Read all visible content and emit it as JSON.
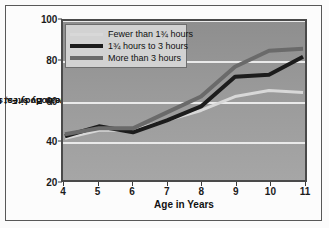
{
  "chart_data": {
    "type": "line",
    "title": "",
    "xlabel": "Age in Years",
    "ylabel": "Mean Body Fat Index (mm of fat at five body sites, summed)",
    "ylabel_line1": "Mean Body Fat Index (mm of",
    "ylabel_line2": "fat at five body sites, summed)",
    "x": [
      4,
      5,
      6,
      7,
      8,
      9,
      10,
      11
    ],
    "categories": [
      "4",
      "5",
      "6",
      "7",
      "8",
      "9",
      "10",
      "11"
    ],
    "xlim": [
      4,
      11
    ],
    "ylim": [
      20,
      100
    ],
    "yticks": [
      20,
      40,
      60,
      80,
      100
    ],
    "ytick_labels": [
      "20",
      "40",
      "60",
      "80",
      "100"
    ],
    "grid": true,
    "grid_color": "#eaeaea",
    "legend_position": "upper-left",
    "plot_background": "#9a9a9a",
    "series": [
      {
        "name": "Fewer than 1¾ hours",
        "color": "#d8d8d8",
        "width": 3,
        "values": [
          41,
          45,
          45,
          50,
          55,
          62,
          65,
          64
        ]
      },
      {
        "name": "1¾ hours to 3 hours",
        "color": "#1c1c1c",
        "width": 4,
        "values": [
          42,
          47,
          44,
          50,
          57,
          72,
          73,
          82
        ]
      },
      {
        "name": "More than 3 hours",
        "color": "#6a6a6a",
        "width": 4,
        "values": [
          43,
          46,
          46,
          54,
          62,
          77,
          85,
          86
        ]
      }
    ]
  },
  "legend": {
    "items": [
      {
        "label": "Fewer than 1¾ hours",
        "color": "#d8d8d8",
        "thickness": 3
      },
      {
        "label": "1¾ hours to 3 hours",
        "color": "#1c1c1c",
        "thickness": 4
      },
      {
        "label": "More than 3 hours",
        "color": "#6a6a6a",
        "thickness": 4
      }
    ]
  }
}
